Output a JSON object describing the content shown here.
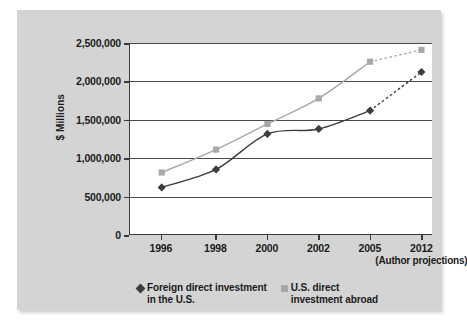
{
  "chart_data": {
    "type": "line",
    "title": "",
    "xlabel": "",
    "ylabel": "$ Millions",
    "categories": [
      "1996",
      "1998",
      "2000",
      "2002",
      "2005",
      "2012"
    ],
    "x_sub_labels": [
      "",
      "",
      "",
      "",
      "",
      "(Author\nprojections)"
    ],
    "ylim": [
      0,
      2500000
    ],
    "y_ticks": [
      "0",
      "500,000",
      "1,000,000",
      "1,500,000",
      "2,000,000",
      "2,500,000"
    ],
    "y_tick_values": [
      0,
      500000,
      1000000,
      1500000,
      2000000,
      2500000
    ],
    "grid": true,
    "legend_position": "bottom",
    "series": [
      {
        "name": "Foreign direct investment\nin the U.S.",
        "marker": "diamond",
        "color": "#3d3d3d",
        "values": [
          610000,
          845000,
          1310000,
          1375000,
          1615000,
          2120000
        ],
        "projected_from": "2005",
        "projected_style": "dashed"
      },
      {
        "name": "U.S. direct\ninvestment abroad",
        "marker": "square",
        "color": "#a8a8a8",
        "values": [
          805000,
          1105000,
          1440000,
          1775000,
          2255000,
          2410000
        ],
        "projected_from": "2005",
        "projected_style": "dashed"
      }
    ]
  },
  "figure": {
    "panel_color": "#d4d4d4",
    "plot_background": "#ffffff",
    "axis_color": "#3a3a3a"
  }
}
